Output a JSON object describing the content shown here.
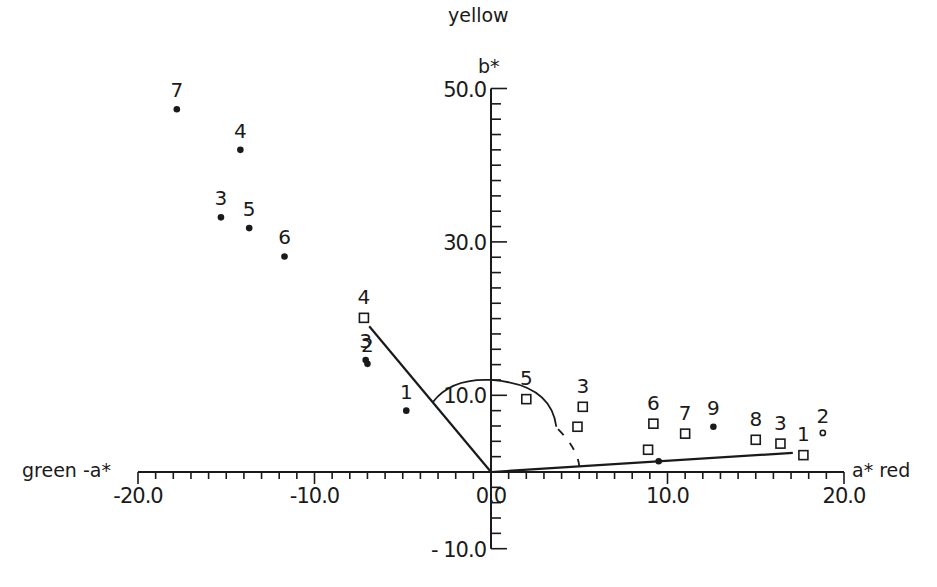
{
  "chart_data": {
    "type": "scatter",
    "title": "",
    "xlabel_positive": "a* red",
    "xlabel_negative": "green -a*",
    "ylabel_positive": "yellow",
    "ylabel_symbol": "b*",
    "xlim": [
      -20,
      20
    ],
    "ylim": [
      -10,
      50
    ],
    "x_ticks": [
      -20.0,
      -10.0,
      0.0,
      10.0,
      20.0
    ],
    "x_tick_labels": [
      "-20.0",
      "-10.0",
      "0.0",
      "10.0",
      "20.0"
    ],
    "y_ticks": [
      50.0,
      30.0,
      10.0,
      -10.0
    ],
    "y_tick_labels": [
      "50.0",
      "30.0",
      "10.0",
      "- 10.0"
    ],
    "x_minor_step": 1,
    "y_minor_step": 2,
    "grid": false,
    "legend": null,
    "series": [
      {
        "name": "filled dots",
        "marker": "dot",
        "points": [
          {
            "label": "7",
            "x": -17.8,
            "y": 47.3
          },
          {
            "label": "4",
            "x": -14.2,
            "y": 42.0
          },
          {
            "label": "3",
            "x": -15.3,
            "y": 33.2
          },
          {
            "label": "5",
            "x": -13.7,
            "y": 31.8
          },
          {
            "label": "6",
            "x": -11.7,
            "y": 28.1
          },
          {
            "label": "3",
            "x": -7.1,
            "y": 14.6
          },
          {
            "label": "2",
            "x": -7.0,
            "y": 14.1
          },
          {
            "label": "1",
            "x": -4.8,
            "y": 8.0
          },
          {
            "label": "9",
            "x": 12.6,
            "y": 5.9
          },
          {
            "label": "",
            "x": 9.5,
            "y": 1.4
          }
        ]
      },
      {
        "name": "open squares",
        "marker": "square",
        "points": [
          {
            "label": "4",
            "x": -7.2,
            "y": 20.1
          },
          {
            "label": "5",
            "x": 2.0,
            "y": 9.5
          },
          {
            "label": "3",
            "x": 5.2,
            "y": 8.5
          },
          {
            "label": "",
            "x": 4.9,
            "y": 5.9
          },
          {
            "label": "6",
            "x": 9.2,
            "y": 6.3
          },
          {
            "label": "7",
            "x": 11.0,
            "y": 5.0
          },
          {
            "label": "",
            "x": 8.9,
            "y": 2.9
          },
          {
            "label": "8",
            "x": 15.0,
            "y": 4.2
          },
          {
            "label": "3",
            "x": 16.4,
            "y": 3.7
          },
          {
            "label": "1",
            "x": 17.7,
            "y": 2.2
          }
        ]
      },
      {
        "name": "open circle",
        "marker": "circle",
        "points": [
          {
            "label": "2",
            "x": 18.8,
            "y": 5.1
          }
        ]
      }
    ],
    "lines": [
      {
        "name": "hue line left",
        "from": [
          0,
          0
        ],
        "to": [
          -6.9,
          19.0
        ]
      },
      {
        "name": "hue line right",
        "from": [
          0,
          0
        ],
        "to": [
          17.1,
          2.5
        ]
      }
    ],
    "arc": {
      "name": "chroma arc",
      "center": [
        0,
        0
      ],
      "radius_b": 12.0,
      "a_end": 5.0,
      "note": "from line-left intersection across b axis, dashed near end"
    }
  }
}
